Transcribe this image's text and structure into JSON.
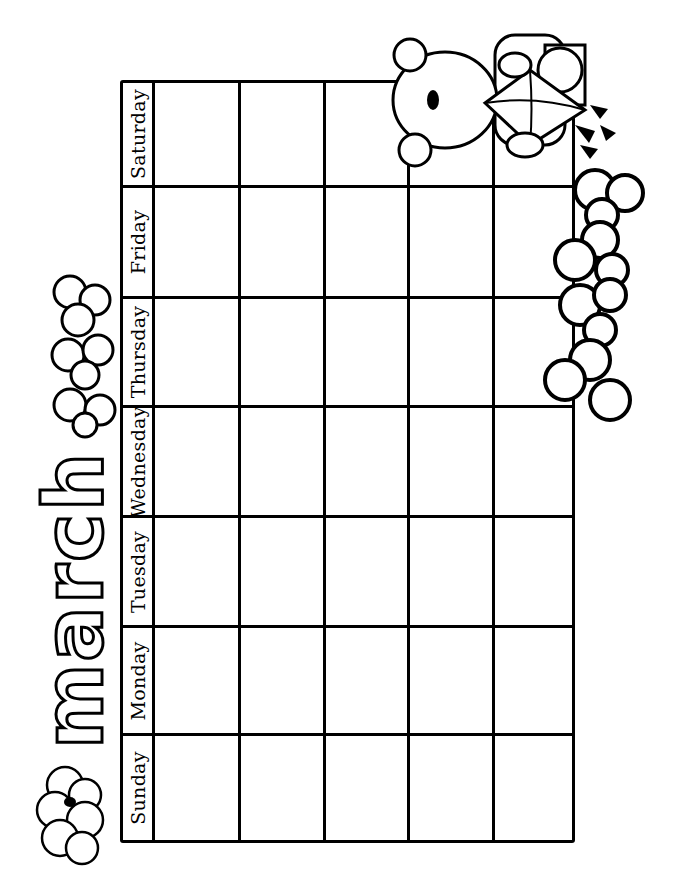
{
  "title": "march",
  "days": [
    "Sunday",
    "Monday",
    "Tuesday",
    "Wednesday",
    "Thursday",
    "Friday",
    "Saturday"
  ],
  "weeks": 5,
  "colors": {
    "ink": "#000000",
    "paper": "#ffffff"
  },
  "decorations": [
    "bear-with-kite",
    "clover-cluster-top",
    "clover-cluster-right",
    "cloud-with-bee"
  ]
}
